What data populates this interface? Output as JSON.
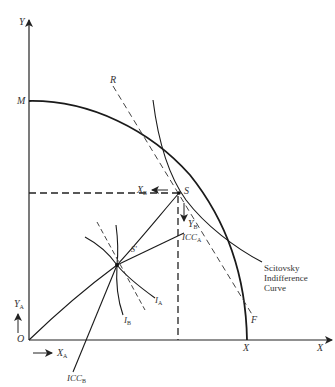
{
  "diagram": {
    "type": "general-equilibrium-box-diagram",
    "axes": {
      "y_label": "Y",
      "x_label": "X",
      "origin_label": "O"
    },
    "points": {
      "M": "M",
      "X_intercept": "X",
      "S": "S",
      "S_prime": "S'",
      "R": "R",
      "F": "F"
    },
    "arrows": {
      "XA": {
        "base": "X",
        "sub": "A"
      },
      "XB": {
        "base": "X",
        "sub": "B"
      },
      "YA": {
        "base": "Y",
        "sub": "A"
      },
      "YB": {
        "base": "Y",
        "sub": "B"
      }
    },
    "curves": {
      "ICC_A": {
        "base": "ICC",
        "sub": "A"
      },
      "ICC_B": {
        "base": "ICC",
        "sub": "B"
      },
      "I_A": {
        "base": "I",
        "sub": "A"
      },
      "I_B": {
        "base": "I",
        "sub": "B"
      },
      "scitovsky_line1": "Scitovsky",
      "scitovsky_line2": "Indifference",
      "scitovsky_line3": "Curve"
    },
    "colors": {
      "line": "#1a1a1a",
      "dashed": "#333333",
      "background": "#ffffff"
    }
  }
}
